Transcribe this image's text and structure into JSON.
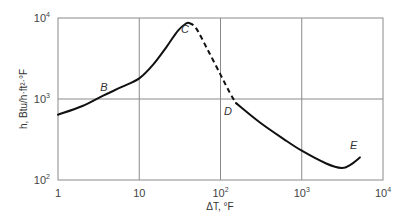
{
  "chart_data": {
    "type": "line",
    "title": "",
    "xlabel": "ΔT, °F",
    "ylabel": "h, Btu/h·ft²·°F",
    "xscale": "log",
    "yscale": "log",
    "xlim": [
      1,
      10000
    ],
    "ylim": [
      100,
      10000
    ],
    "grid": true,
    "x_ticks": [
      {
        "base": "1",
        "exp": ""
      },
      {
        "base": "10",
        "exp": ""
      },
      {
        "base": "10",
        "exp": "2"
      },
      {
        "base": "10",
        "exp": "3"
      },
      {
        "base": "10",
        "exp": "4"
      }
    ],
    "y_ticks": [
      {
        "base": "10",
        "exp": "2"
      },
      {
        "base": "10",
        "exp": "3"
      },
      {
        "base": "10",
        "exp": "4"
      }
    ],
    "series": [
      {
        "name": "nucleate boiling (solid)",
        "style": "solid",
        "x": [
          1,
          2,
          3.6,
          6,
          10,
          15,
          22,
          30,
          38,
          41
        ],
        "y": [
          640,
          820,
          1100,
          1400,
          1800,
          2700,
          4500,
          7000,
          8600,
          8700
        ]
      },
      {
        "name": "transition boiling (dashed)",
        "style": "dashed",
        "x": [
          41,
          50,
          70,
          100,
          130,
          155
        ],
        "y": [
          8700,
          7500,
          4000,
          2000,
          1200,
          890
        ]
      },
      {
        "name": "film boiling (solid)",
        "style": "solid",
        "x": [
          155,
          300,
          600,
          1000,
          2000,
          3100,
          4000,
          5200
        ],
        "y": [
          890,
          520,
          320,
          230,
          160,
          141,
          155,
          190
        ]
      }
    ],
    "annotations": [
      {
        "text": "B",
        "x": 3.6,
        "y": 1100
      },
      {
        "text": "C",
        "x": 41,
        "y": 8700
      },
      {
        "text": "D",
        "x": 155,
        "y": 890
      },
      {
        "text": "E",
        "x": 5200,
        "y": 190
      }
    ]
  },
  "labels": {
    "x_axis": "ΔT, °F",
    "y_axis": "h, Btu/h·ft²·°F"
  },
  "colors": {
    "curve": "#111111",
    "grid": "#8a8a8a",
    "frame": "#8a8a8a"
  }
}
